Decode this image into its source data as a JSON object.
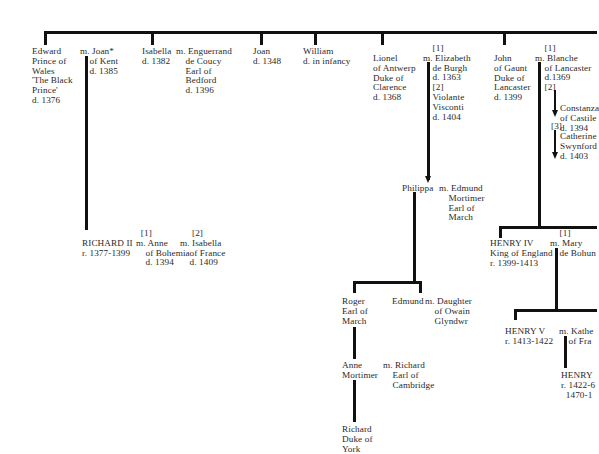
{
  "generation1": {
    "edward": {
      "name": "Edward\nPrince of\nWales\n'The Black\nPrince'\nd. 1376",
      "spouse": "m. Joan*\n    of Kent\n    d. 1385"
    },
    "isabella": {
      "name": "Isabella\nd. 1382",
      "spouse": "m. Enguerrand\n    de Coucy\n    Earl of\n    Bedford\n    d. 1396"
    },
    "joan": {
      "name": "Joan\nd. 1348"
    },
    "william": {
      "name": "William\nd. in infancy"
    },
    "lionel": {
      "name": "Lionel\nof Antwerp\nDuke of\nClarence\nd. 1368",
      "spouse": "    [1]\nm. Elizabeth\n    de Burgh\n    d. 1363\n    [2]\n    Violante\n    Visconti\n    d. 1404"
    },
    "john": {
      "name": "John\nof Gaunt\nDuke of\nLancaster\nd. 1399",
      "spouse1": "    [1]\nm. Blanche\n    of Lancaster\n    d.1369\n    [2]",
      "spouse2": "Constanza\nof Castile\nd. 1394",
      "spouse3_label": "[3]",
      "spouse3": "Catherine\nSwynford\nd. 1403"
    }
  },
  "generation2": {
    "richard": {
      "name": "RICHARD II\nr. 1377-1399",
      "spouse1": "  [1]\nm. Anne\n    of Bohemia\n    d. 1394",
      "spouse2": "     [2]\nm. Isabella\n    of France\n    d. 1409"
    },
    "philippa": {
      "name": "Philippa",
      "spouse": "m. Edmund\n    Mortimer\n    Earl of\n    March"
    },
    "henry4": {
      "name": "HENRY IV\nKing of England\nr. 1399-1413",
      "spouse": "    [1]\nm. Mary\n    de Bohun"
    }
  },
  "generation3": {
    "roger": {
      "name": "Roger\nEarl of\nMarch"
    },
    "edmund": {
      "name": "Edmund",
      "spouse": "m. Daughter\n    of Owain\n    Glyndwr"
    },
    "henry5": {
      "name": "HENRY V\nr. 1413-1422",
      "spouse": "m. Kathe\n    of Fra"
    }
  },
  "generation4": {
    "anne": {
      "name": "Anne\nMortimer",
      "spouse": "m. Richard\n    Earl of\n    Cambridge"
    },
    "henry6": {
      "name": "HENRY\nr. 1422-6\n  1470-1"
    }
  },
  "generation5": {
    "richard_york": {
      "name": "Richard\nDuke of\nYork"
    }
  }
}
